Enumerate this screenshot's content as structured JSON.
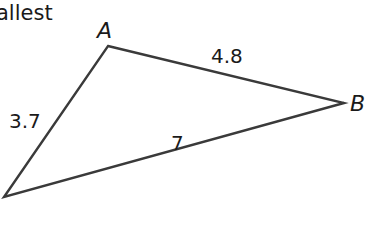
{
  "caption": "allest",
  "triangle": {
    "vertices": {
      "A": {
        "label": "A",
        "x": 108,
        "y": 46
      },
      "B": {
        "label": "B",
        "x": 344,
        "y": 103
      },
      "C": {
        "label": "",
        "x": 4,
        "y": 197
      }
    },
    "sides": {
      "AB": "4.8",
      "AC": "3.7",
      "BC": "7"
    },
    "stroke_color": "#3a3a3a"
  }
}
